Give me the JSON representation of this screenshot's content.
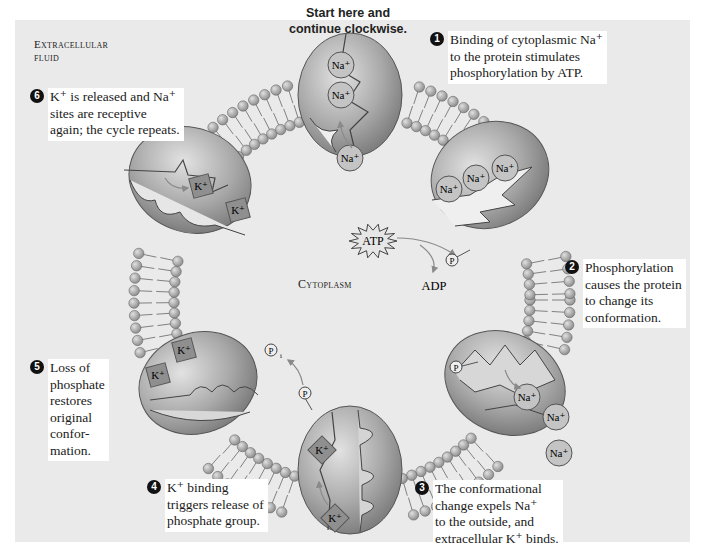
{
  "figure": {
    "start_label": "Start here and\ncontinue clockwise.",
    "regions": {
      "extracellular": "Extracellular\nfluid",
      "cytoplasm": "Cytoplasm"
    },
    "steps": [
      {
        "number": "1",
        "text": "Binding of cytoplasmic Na⁺\nto the protein stimulates\nphosphorylation by ATP."
      },
      {
        "number": "2",
        "text": "Phosphorylation\ncauses the protein\nto change its\nconformation."
      },
      {
        "number": "3",
        "text": "The conformational\nchange expels Na⁺\nto the outside, and\nextracellular K⁺ binds."
      },
      {
        "number": "4",
        "text": "K⁺ binding\ntriggers release of\nphosphate group."
      },
      {
        "number": "5",
        "text": "Loss of\nphosphate\nrestores\noriginal\nconfor-\nmation."
      },
      {
        "number": "6",
        "text": "K⁺ is released and Na⁺\nsites are receptive\nagain; the cycle repeats."
      }
    ],
    "molecules": {
      "na": "Na⁺",
      "k": "K⁺",
      "atp": "ATP",
      "adp": "ADP",
      "phosphate": "P",
      "inorganic_phosphate_sub": "i"
    },
    "colors": {
      "panel_bg": "#eaeaea",
      "protein": "#9c9c9c",
      "protein_light": "#cfcfcf",
      "ion_fill": "#bdbdbd",
      "k_fill": "#8f8f8f",
      "lipid_head": "#a9a9a9",
      "badge": "#111111"
    }
  }
}
